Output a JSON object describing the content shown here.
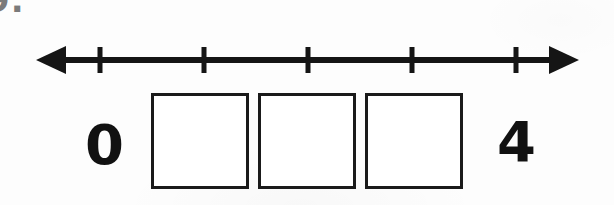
{
  "worksheet": {
    "problem_number": "9.",
    "number_line": {
      "left_arrow_icon": "arrow-left-icon",
      "right_arrow_icon": "arrow-right-icon",
      "tick_count": 5,
      "tick_positions_px": [
        100,
        204,
        308,
        412,
        516
      ],
      "tick_labels": [
        "",
        "",
        "",
        "",
        ""
      ]
    },
    "answer_boxes": [
      {
        "value": ""
      },
      {
        "value": ""
      },
      {
        "value": ""
      }
    ],
    "endpoints": {
      "start_label": "0",
      "end_label": "4"
    },
    "colors": {
      "ink": "#151515",
      "box_border": "#1a1a1a",
      "paper": "#fdfdfd",
      "problem_number": "#7b7b7b"
    }
  }
}
